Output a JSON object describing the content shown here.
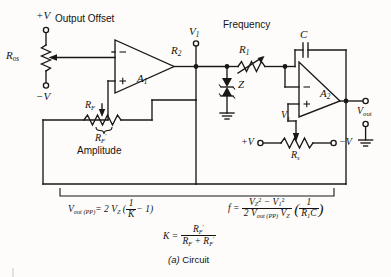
{
  "figure": {
    "caption": "(a) Circuit",
    "title_note": "Wien-bridge / function generator circuit schematic"
  },
  "labels": {
    "supply_pos_top": "+V",
    "supply_neg_top": "−V",
    "output_offset": "Output Offset",
    "r_os": "R",
    "r_os_sub": "os",
    "amplifier1": "A",
    "amplifier1_sub": "1",
    "amplifier2": "A",
    "amplifier2_sub": "2",
    "opamp_minus": "−",
    "opamp_plus": "+",
    "r_f": "R",
    "r_f_sub": "F",
    "r_f_prime": "R",
    "r_f_prime_sub": "F",
    "r_f_prime_mark": "′",
    "amplitude": "Amplitude",
    "v1": "V",
    "v1_sub": "1",
    "r2": "R",
    "r2_sub": "2",
    "zener": "Z",
    "frequency": "Frequency",
    "r1": "R",
    "r1_sub": "1",
    "capacitor": "C",
    "vs": "V",
    "vs_sub": "s",
    "rs": "R",
    "rs_sub": "s",
    "supply_pos_bottom": "+V",
    "supply_neg_bottom": "−V",
    "vout": "V",
    "vout_sub": "out"
  },
  "equations": {
    "vout_pp": {
      "lhs": "V",
      "lhs_sub": "out (PP)",
      "eq": "=",
      "coeff": "2 V",
      "coeff_sub": "Z",
      "open_paren": "(",
      "frac_num": "1",
      "frac_den": "K",
      "minus_one": "− 1",
      "close_paren": ")",
      "full_text": "V_out(PP) = 2 V_Z (1/K − 1)"
    },
    "frequency": {
      "lhs": "f",
      "eq": "=",
      "num_v2": "V",
      "num_v2_sub": "Z",
      "num_v2_sup": "2",
      "num_minus": "−",
      "num_v1": "V",
      "num_v1_sub": "1",
      "num_v1_sup": "2",
      "den_2": "2 V",
      "den_out_sub": "out (PP)",
      "den_vz": "V",
      "den_vz_sub": "Z",
      "paren_num": "1",
      "paren_den_r": "R",
      "paren_den_r_sub": "1",
      "paren_den_c": "C",
      "full_text": "f = (V_Z^2 − V_1^2) / (2 V_out(PP) V_Z) × (1/(R_1 C))"
    },
    "k_factor": {
      "lhs": "K",
      "eq": "=",
      "num_r": "R",
      "num_r_sub": "F",
      "num_prime": "′",
      "den_r1": "R",
      "den_r1_sub": "F",
      "den_plus": "+",
      "den_r2": "R",
      "den_r2_sub": "F",
      "den_prime": "′",
      "full_text": "K = R_F′ / (R_F + R_F′)"
    }
  },
  "colors": {
    "ink": "#1a1714",
    "paper": "#fdfcfa"
  }
}
